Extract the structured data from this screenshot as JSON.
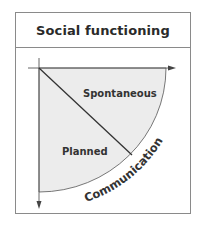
{
  "figure": {
    "title": "Social functioning",
    "regions": [
      {
        "label": "Spontaneous",
        "position": "upper-right of diagonal"
      },
      {
        "label": "Planned",
        "position": "lower-left of diagonal"
      }
    ],
    "arc_label": "Communication",
    "colors": {
      "frame": "#8a8a8a",
      "fill": "#ebebeb",
      "line": "#333333",
      "text": "#2a2a2a"
    }
  }
}
